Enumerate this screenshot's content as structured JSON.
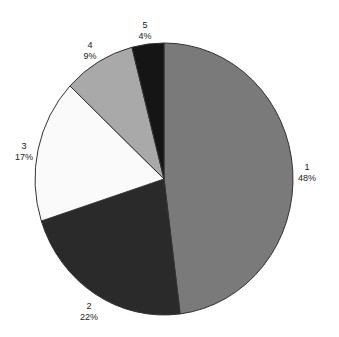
{
  "chart_data": {
    "type": "pie",
    "title": "",
    "categories": [
      "1",
      "2",
      "3",
      "4",
      "5"
    ],
    "values": [
      48,
      22,
      17,
      9,
      4
    ],
    "labels": [
      "48%",
      "22%",
      "17%",
      "9%",
      "4%"
    ],
    "colors": [
      "#7a7a7a",
      "#2a2a2a",
      "#fafafa",
      "#a9a9a9",
      "#151515"
    ],
    "start_angle_deg": 90,
    "direction": "clockwise",
    "legend": "none"
  },
  "slices": [
    {
      "name": "1",
      "pct": "48%"
    },
    {
      "name": "2",
      "pct": "22%"
    },
    {
      "name": "3",
      "pct": "17%"
    },
    {
      "name": "4",
      "pct": "9%"
    },
    {
      "name": "5",
      "pct": "4%"
    }
  ]
}
